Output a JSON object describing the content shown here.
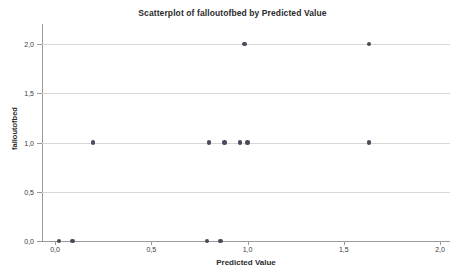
{
  "chart_data": {
    "type": "scatter",
    "title": "Scatterplot of falloutofbed by Predicted Value",
    "xlabel": "Predicted Value",
    "ylabel": "falloutofbed",
    "xlim": [
      -0.07,
      2.07
    ],
    "ylim": [
      -0.05,
      2.12
    ],
    "xticks": [
      0.0,
      0.5,
      1.0,
      1.5,
      2.0
    ],
    "xtick_labels": [
      "0,0",
      "0,5",
      "1,0",
      "1,5",
      "2,0"
    ],
    "yticks": [
      0.0,
      0.5,
      1.0,
      1.5,
      2.0
    ],
    "ytick_labels": [
      "0,0",
      "0,5",
      "1,0",
      "1,5",
      "2,0"
    ],
    "grid": "horizontal",
    "legend": null,
    "marker_color": "#4a4a58",
    "points": [
      {
        "x": 0.02,
        "y": 0.0
      },
      {
        "x": 0.09,
        "y": 0.0
      },
      {
        "x": 0.79,
        "y": 0.0
      },
      {
        "x": 0.86,
        "y": 0.0
      },
      {
        "x": 0.197,
        "y": 1.0
      },
      {
        "x": 0.8,
        "y": 1.0
      },
      {
        "x": 0.88,
        "y": 1.0
      },
      {
        "x": 0.96,
        "y": 1.0
      },
      {
        "x": 1.0,
        "y": 1.0
      },
      {
        "x": 1.63,
        "y": 1.0
      },
      {
        "x": 0.985,
        "y": 2.0
      },
      {
        "x": 1.63,
        "y": 2.0
      }
    ]
  }
}
